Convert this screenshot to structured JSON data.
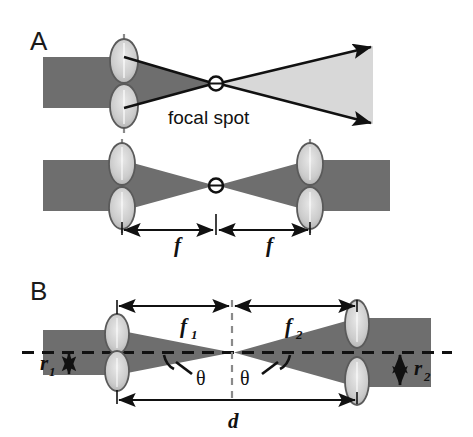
{
  "figure": {
    "type": "optics-ray-diagram",
    "background_color": "#ffffff",
    "beam_dark_color": "#6e6e6e",
    "beam_light_color": "#d8d8d8",
    "lens_fill_color": "#c9c9c9",
    "line_color": "#111111",
    "panels": [
      {
        "id": "A",
        "label": "A",
        "label_x": 30,
        "label_y": 50,
        "annotations": [
          {
            "name": "focal-spot-label",
            "text": "focal spot",
            "x": 168,
            "y": 124
          }
        ],
        "diagrams": [
          {
            "name": "single-lens-focus",
            "description": "Collimated dark beam enters from left, single lens focuses to focal spot, light beam diverges to right with arrowheads"
          },
          {
            "name": "two-lens-relay",
            "description": "Dark collimated beam enters left lens, focuses at midpoint focal spot, re-collimated by right lens"
          }
        ],
        "dimensions": [
          {
            "name": "focal-length-left",
            "label": "f",
            "subscript": "",
            "x": 178,
            "y": 250
          },
          {
            "name": "focal-length-right",
            "label": "f",
            "subscript": "",
            "x": 268,
            "y": 250
          }
        ]
      },
      {
        "id": "B",
        "label": "B",
        "label_x": 30,
        "label_y": 300,
        "annotations": [
          {
            "name": "angle-left",
            "text": "θ",
            "x": 203,
            "y": 378
          },
          {
            "name": "angle-right",
            "text": "θ",
            "x": 245,
            "y": 378
          }
        ],
        "dimensions": [
          {
            "name": "focal-length-f1",
            "label": "f",
            "subscript": "1",
            "x": 186,
            "y": 329
          },
          {
            "name": "focal-length-f2",
            "label": "f",
            "subscript": "2",
            "x": 290,
            "y": 329
          },
          {
            "name": "beam-radius-r1",
            "label": "r",
            "subscript": "1",
            "x": 43,
            "y": 364
          },
          {
            "name": "beam-radius-r2",
            "label": "r",
            "subscript": "2",
            "x": 422,
            "y": 365
          },
          {
            "name": "lens-separation-d",
            "label": "d",
            "subscript": "",
            "x": 232,
            "y": 430
          }
        ],
        "description": "Two lenses of different focal lengths f1 and f2 separated by distance d, input beam radius r1 expanded to output beam radius r2, half-angle theta on both sides of the common focus"
      }
    ]
  }
}
